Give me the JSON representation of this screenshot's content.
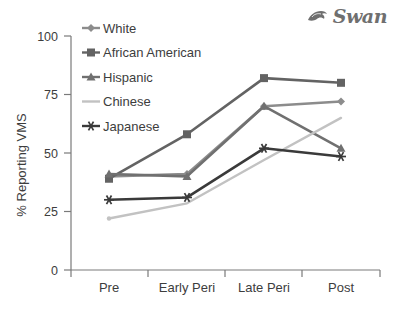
{
  "logo": {
    "text": "Swan",
    "icon": "swan-bird-icon",
    "color": "#6f6f6f"
  },
  "chart_data": {
    "type": "line",
    "title": "",
    "xlabel": "",
    "ylabel": "% Reporting VMS",
    "categories": [
      "Pre",
      "Early Peri",
      "Late Peri",
      "Post"
    ],
    "ylim": [
      0,
      100
    ],
    "yticks": [
      0,
      25,
      50,
      75,
      100
    ],
    "ytick_labels": [
      "0",
      "25",
      "50",
      "75",
      "100"
    ],
    "grid": false,
    "legend_position": "upper left inside",
    "series": [
      {
        "name": "White",
        "values": [
          40,
          41,
          70,
          72
        ],
        "color": "#8c8c8c",
        "marker": "diamond"
      },
      {
        "name": "African American",
        "values": [
          39,
          58,
          82,
          80
        ],
        "color": "#636363",
        "marker": "square"
      },
      {
        "name": "Hispanic",
        "values": [
          41,
          40,
          70,
          52
        ],
        "color": "#707070",
        "marker": "triangle"
      },
      {
        "name": "Chinese",
        "values": [
          22,
          28.5,
          47,
          65
        ],
        "color": "#c2c2c2",
        "marker": "none"
      },
      {
        "name": "Japanese",
        "values": [
          30,
          31,
          52,
          48.5
        ],
        "color": "#3a3a3a",
        "marker": "asterisk"
      }
    ]
  }
}
